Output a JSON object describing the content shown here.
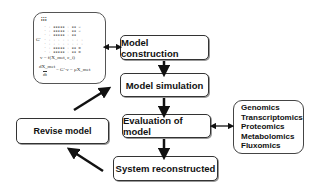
{
  "diagram": {
    "boxes": {
      "model_construction": "Model construction",
      "model_simulation": "Model simulation",
      "evaluation": "Evaluation of model",
      "system_reconstructed": "System reconstructed",
      "revise_model": "Revise model"
    },
    "omics": [
      "Genomics",
      "Transcriptomics",
      "Proteomics",
      "Metabolomics",
      "Fluxomics"
    ],
    "matrix_panel": {
      "matrix_label": "G'",
      "equation_1": "v = f(X_met, c_i)",
      "equation_2_num": "dX_met",
      "equation_2_den": "dt",
      "equation_2_rhs": "= G'·v − μX_met"
    }
  }
}
